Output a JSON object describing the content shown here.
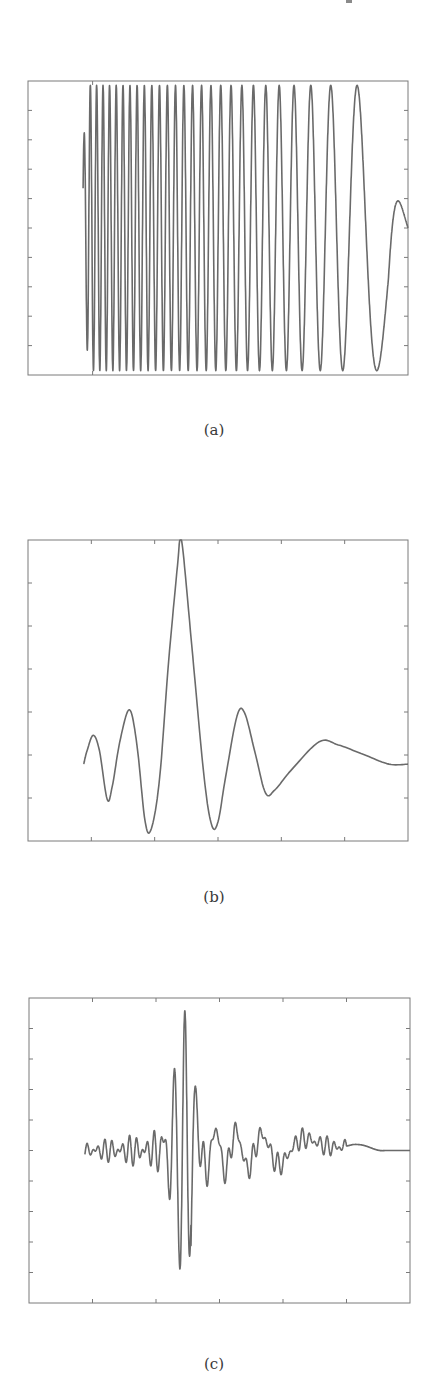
{
  "page": {
    "width": 428,
    "height": 1394,
    "background": "#ffffff"
  },
  "style": {
    "line_color": "#6a6a6a",
    "axes_color": "#7a7a7a",
    "line_width": 1.6
  },
  "chart_data": [
    {
      "id": "a",
      "type": "line",
      "caption": "(a)",
      "description": "Chirp signal: frequency decreasing from left to right, full-amplitude oscillation ending mid-level",
      "title": "",
      "xlabel": "",
      "ylabel": "",
      "box": {
        "x0": 28,
        "y0": 81,
        "x1": 408,
        "y1": 375
      },
      "xlim": [
        0,
        1
      ],
      "ylim": [
        -1,
        1
      ],
      "yticks_count": 9,
      "xticks": [
        0.17
      ],
      "grid": false,
      "signal": {
        "kind": "chirp",
        "x_start": 0.145,
        "x_end": 1.0,
        "amplitude": 0.97,
        "start_value": 0.45,
        "end_value": 0.0,
        "cycles": 28,
        "last_peak_x": 0.915
      },
      "caption_y": 430
    },
    {
      "id": "b",
      "type": "line",
      "caption": "(b)",
      "description": "Sinc-like pulse: tall central peak with decaying side lobes, trailing slow wave",
      "title": "",
      "xlabel": "",
      "ylabel": "",
      "box": {
        "x0": 28,
        "y0": 540,
        "x1": 408,
        "y1": 841
      },
      "xlim": [
        0,
        6
      ],
      "ylim": [
        -1.2,
        3.5
      ],
      "yticks_count": 6,
      "xticks": [
        1,
        2,
        3,
        4,
        5
      ],
      "grid": false,
      "points": [
        [
          0.88,
          0.0
        ],
        [
          0.93,
          0.2
        ],
        [
          1.03,
          0.45
        ],
        [
          1.13,
          0.2
        ],
        [
          1.25,
          -0.55
        ],
        [
          1.33,
          -0.35
        ],
        [
          1.45,
          0.35
        ],
        [
          1.6,
          0.85
        ],
        [
          1.72,
          0.3
        ],
        [
          1.85,
          -0.9
        ],
        [
          1.95,
          -1.0
        ],
        [
          2.08,
          -0.2
        ],
        [
          2.22,
          1.6
        ],
        [
          2.36,
          3.1
        ],
        [
          2.4,
          3.5
        ],
        [
          2.45,
          3.3
        ],
        [
          2.6,
          1.7
        ],
        [
          2.78,
          -0.2
        ],
        [
          2.9,
          -0.95
        ],
        [
          3.0,
          -0.9
        ],
        [
          3.12,
          -0.2
        ],
        [
          3.3,
          0.75
        ],
        [
          3.42,
          0.8
        ],
        [
          3.58,
          0.2
        ],
        [
          3.75,
          -0.45
        ],
        [
          3.9,
          -0.4
        ],
        [
          4.15,
          -0.1
        ],
        [
          4.6,
          0.35
        ],
        [
          4.9,
          0.3
        ],
        [
          5.3,
          0.15
        ],
        [
          5.7,
          0.0
        ],
        [
          6.0,
          0.0
        ]
      ],
      "caption_y": 897
    },
    {
      "id": "c",
      "type": "line",
      "caption": "(c)",
      "description": "Wave packet: small high-frequency ripples, strong burst near center, decaying lower-frequency tail, flat at end",
      "title": "",
      "xlabel": "",
      "ylabel": "",
      "box": {
        "x0": 29,
        "y0": 998,
        "x1": 410,
        "y1": 1303
      },
      "xlim": [
        0,
        6
      ],
      "ylim": [
        -5,
        5
      ],
      "yticks_count": 9,
      "xticks": [
        1,
        2,
        3,
        4,
        5
      ],
      "grid": false,
      "signal": {
        "kind": "packet",
        "x_start": 0.88,
        "x_end": 6.0,
        "center_x": 2.42,
        "peak_amp": 4.5,
        "max_up": 4.5,
        "max_down": -5.0
      },
      "caption_y": 1364
    }
  ]
}
